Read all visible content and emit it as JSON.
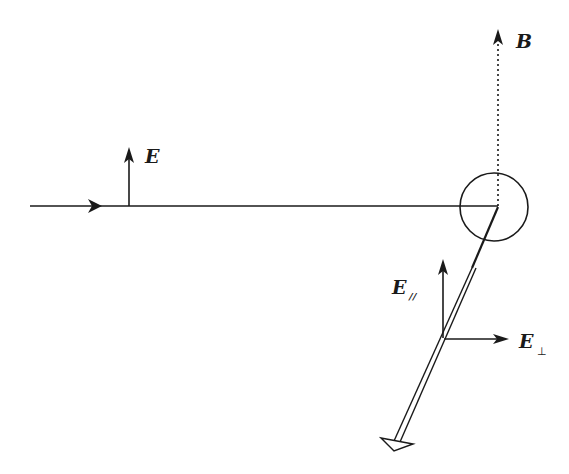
{
  "diagram": {
    "type": "physics-polarization-diagram",
    "colors": {
      "stroke": "#1a1a1a",
      "background": "#ffffff"
    },
    "labels": {
      "E": "E",
      "B": "B",
      "E_parallel_main": "E",
      "E_parallel_sub": "//",
      "E_perp_main": "E",
      "E_perp_sub": "⊥"
    },
    "elements": [
      {
        "name": "incident-beam",
        "desc": "horizontal line with arrow from left to scattering center"
      },
      {
        "name": "e-field-arrow",
        "desc": "vertical arrow labeled E on incident beam"
      },
      {
        "name": "b-field-dotted-arrow",
        "desc": "dotted vertical arrow labeled B from scatter center upward"
      },
      {
        "name": "scatter-circle",
        "desc": "circle around scattering point"
      },
      {
        "name": "scattered-beam",
        "desc": "double line going down-left ending in outlined arrowhead"
      },
      {
        "name": "e-parallel-arrow",
        "desc": "vertical arrow labeled E parallel"
      },
      {
        "name": "e-perp-arrow",
        "desc": "horizontal arrow labeled E perpendicular"
      }
    ]
  }
}
